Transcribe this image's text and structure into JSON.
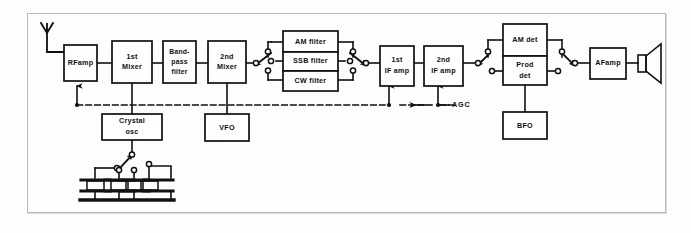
{
  "diagram": {
    "background_color": "#fdfdfd",
    "line_color": "#101010",
    "frame_color": "#b9b9b9",
    "blocks": [
      {
        "id": "rf_amp",
        "label": "RFamp",
        "lines": [
          "RFamp"
        ]
      },
      {
        "id": "first_mixer",
        "label": "1st Mixer",
        "lines": [
          "1st",
          "Mixer"
        ]
      },
      {
        "id": "bandpass",
        "label": "Band-pass filter",
        "lines": [
          "Band-",
          "pass",
          "filter"
        ]
      },
      {
        "id": "second_mixer",
        "label": "2nd Mixer",
        "lines": [
          "2nd",
          "Mixer"
        ]
      },
      {
        "id": "am_filter",
        "label": "AM filter",
        "lines": [
          "AM filter"
        ]
      },
      {
        "id": "ssb_filter",
        "label": "SSB filter",
        "lines": [
          "SSB filter"
        ]
      },
      {
        "id": "cw_filter",
        "label": "CW filter",
        "lines": [
          "CW filter"
        ]
      },
      {
        "id": "first_if",
        "label": "1st IF amp",
        "lines": [
          "1st",
          "IF amp"
        ]
      },
      {
        "id": "second_if",
        "label": "2nd IF amp",
        "lines": [
          "2nd",
          "IF amp"
        ]
      },
      {
        "id": "am_det",
        "label": "AM det",
        "lines": [
          "AM det"
        ]
      },
      {
        "id": "prod_det",
        "label": "Prod det",
        "lines": [
          "Prod",
          "det"
        ]
      },
      {
        "id": "af_amp",
        "label": "AFamp",
        "lines": [
          "AFamp"
        ]
      },
      {
        "id": "crystal_osc",
        "label": "Crystal osc",
        "lines": [
          "Crystal",
          "osc"
        ]
      },
      {
        "id": "vfo",
        "label": "VFO",
        "lines": [
          "VFO"
        ]
      },
      {
        "id": "bfo",
        "label": "BFO",
        "lines": [
          "BFO"
        ]
      }
    ],
    "signals": [
      {
        "id": "agc",
        "label": "AGC"
      }
    ],
    "symbols": [
      {
        "id": "antenna",
        "name": "antenna-symbol",
        "count": 1
      },
      {
        "id": "speaker",
        "name": "speaker-symbol",
        "count": 1
      },
      {
        "id": "crystal_bank",
        "name": "crystal-symbol",
        "count": 4
      },
      {
        "id": "filter_switch_in",
        "name": "rotary-switch",
        "count": 1
      },
      {
        "id": "filter_switch_out",
        "name": "rotary-switch",
        "count": 1
      },
      {
        "id": "det_switch_in",
        "name": "rotary-switch",
        "count": 1
      },
      {
        "id": "det_switch_out",
        "name": "rotary-switch",
        "count": 1
      },
      {
        "id": "crystal_switch",
        "name": "rotary-switch",
        "count": 1
      }
    ]
  }
}
